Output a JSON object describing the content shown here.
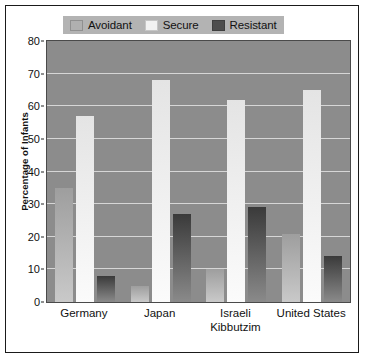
{
  "chart_data": {
    "type": "bar",
    "title": "",
    "xlabel": "",
    "ylabel": "Percentage of Infants",
    "categories": [
      "Germany",
      "Japan",
      "Israeli Kibbutzim",
      "United States"
    ],
    "category_lines": [
      [
        "Germany"
      ],
      [
        "Japan"
      ],
      [
        "Israeli",
        "Kibbutzim"
      ],
      [
        "United States"
      ]
    ],
    "series": [
      {
        "name": "Avoidant",
        "color": "#b0b0b0",
        "values": [
          35,
          5,
          10,
          21
        ]
      },
      {
        "name": "Secure",
        "color": "#f2f2f2",
        "values": [
          57,
          68,
          62,
          65
        ]
      },
      {
        "name": "Resistant",
        "color": "#4d4d4d",
        "values": [
          8,
          27,
          29,
          14
        ]
      }
    ],
    "ylim": [
      0,
      80
    ],
    "yticks": [
      0,
      10,
      20,
      30,
      40,
      50,
      60,
      70,
      80
    ],
    "ytick_labels": [
      "0",
      "10",
      "20",
      "30",
      "40",
      "50",
      "60",
      "70",
      "80"
    ],
    "grid": true,
    "legend_position": "top-center",
    "plot_background": "#8c8c8c",
    "gridline_color": "#d6d6d6",
    "figure_background": "#ffffff",
    "border_color": "#1a1a1a"
  },
  "legend": {
    "items": [
      {
        "label": "Avoidant",
        "swatch": "#b0b0b0"
      },
      {
        "label": "Secure",
        "swatch": "#f2f2f2"
      },
      {
        "label": "Resistant",
        "swatch": "#4d4d4d"
      }
    ],
    "background": "#b3b3b3"
  }
}
